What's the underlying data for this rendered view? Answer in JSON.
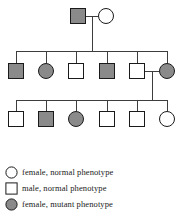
{
  "figure": {
    "colors": {
      "line": "#3d3d3d",
      "symbol_stroke": "#1a1a1a",
      "mutant_fill": "#8a8a8a",
      "normal_fill": "#ffffff",
      "text": "#1a1a1a"
    },
    "symbol_size": 16
  },
  "pedigree": {
    "generations": [
      {
        "id": "generation-1",
        "y": 16,
        "individuals": [
          {
            "id": "I-1",
            "shape": "square",
            "sex": "male",
            "phenotype": "mutant",
            "x": 78
          },
          {
            "id": "I-2",
            "shape": "circle",
            "sex": "female",
            "phenotype": "normal",
            "x": 106
          }
        ]
      },
      {
        "id": "generation-2",
        "y": 71,
        "individuals": [
          {
            "id": "II-1",
            "shape": "square",
            "sex": "male",
            "phenotype": "mutant",
            "x": 16
          },
          {
            "id": "II-2",
            "shape": "circle",
            "sex": "female",
            "phenotype": "mutant",
            "x": 46
          },
          {
            "id": "II-3",
            "shape": "square",
            "sex": "male",
            "phenotype": "normal",
            "x": 76
          },
          {
            "id": "II-4",
            "shape": "square",
            "sex": "male",
            "phenotype": "mutant",
            "x": 107
          },
          {
            "id": "II-5",
            "shape": "square",
            "sex": "male",
            "phenotype": "normal",
            "x": 137
          },
          {
            "id": "II-6",
            "shape": "circle",
            "sex": "female",
            "phenotype": "mutant",
            "x": 167
          }
        ]
      },
      {
        "id": "generation-3",
        "y": 119,
        "individuals": [
          {
            "id": "III-1",
            "shape": "square",
            "sex": "male",
            "phenotype": "normal",
            "x": 16
          },
          {
            "id": "III-2",
            "shape": "square",
            "sex": "male",
            "phenotype": "mutant",
            "x": 46
          },
          {
            "id": "III-3",
            "shape": "circle",
            "sex": "female",
            "phenotype": "mutant",
            "x": 76
          },
          {
            "id": "III-4",
            "shape": "square",
            "sex": "male",
            "phenotype": "normal",
            "x": 107
          },
          {
            "id": "III-5",
            "shape": "square",
            "sex": "male",
            "phenotype": "normal",
            "x": 137
          },
          {
            "id": "III-6",
            "shape": "circle",
            "sex": "female",
            "phenotype": "normal",
            "x": 167
          }
        ]
      }
    ],
    "matings": [
      {
        "id": "mating-1",
        "partners": [
          "I-1",
          "I-2"
        ],
        "mating_y": 16,
        "descent_x": 92,
        "sibship_y": 51
      },
      {
        "id": "mating-2",
        "partners": [
          "II-5",
          "II-6"
        ],
        "mating_y": 71,
        "descent_x": 152,
        "sibship_y": 100
      }
    ],
    "sibships": [
      {
        "id": "sibship-1",
        "generation": "generation-2",
        "y": 51,
        "x_start": 16,
        "x_end": 167
      },
      {
        "id": "sibship-2",
        "generation": "generation-3",
        "y": 100,
        "x_start": 16,
        "x_end": 167
      }
    ]
  },
  "legend": {
    "items": [
      {
        "id": "legend-female-normal",
        "shape": "circle",
        "phenotype": "normal",
        "label": "female, normal phenotype"
      },
      {
        "id": "legend-male-normal",
        "shape": "square",
        "phenotype": "normal",
        "label": "male, normal phenotype"
      },
      {
        "id": "legend-female-mutant",
        "shape": "circle",
        "phenotype": "mutant",
        "label": "female, mutant phenotype"
      }
    ]
  }
}
